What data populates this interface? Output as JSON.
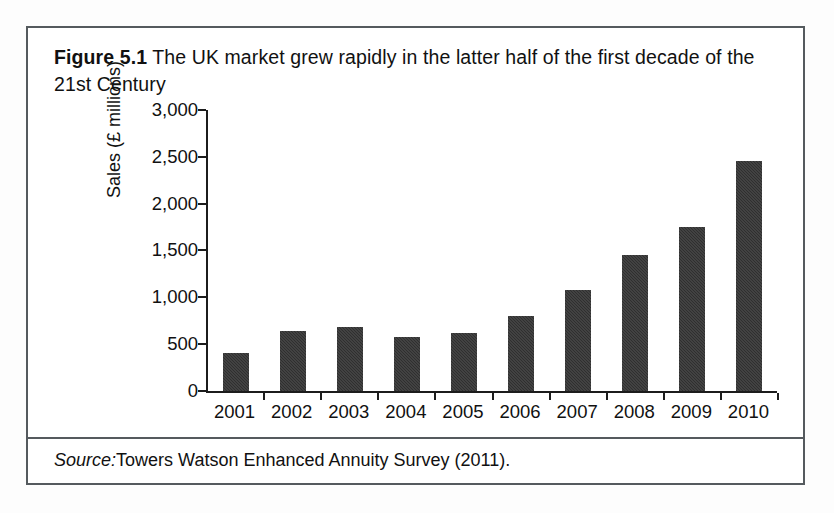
{
  "figure": {
    "caption_label": "Figure 5.1",
    "caption_text": "The UK market grew rapidly in the latter half of the first decade of the 21st Century",
    "source_label": "Source:",
    "source_text": "Towers Watson Enhanced Annuity Survey (2011).",
    "frame_color": "#555a5e",
    "bar_color": "#2f2f2f"
  },
  "chart_data": {
    "type": "bar",
    "title": "The UK market grew rapidly in the latter half of the first decade of the 21st Century",
    "xlabel": "",
    "ylabel": "Sales (£ millions)",
    "categories": [
      "2001",
      "2002",
      "2003",
      "2004",
      "2005",
      "2006",
      "2007",
      "2008",
      "2009",
      "2010"
    ],
    "values": [
      410,
      635,
      680,
      575,
      620,
      800,
      1075,
      1450,
      1745,
      2450
    ],
    "ylim": [
      0,
      3000
    ],
    "yticks": [
      0,
      500,
      1000,
      1500,
      2000,
      2500,
      3000
    ],
    "ytick_labels": [
      "0",
      "500",
      "1,000",
      "1,500",
      "2,000",
      "2,500",
      "3,000"
    ],
    "grid": false,
    "legend": false,
    "series": [
      {
        "name": "Sales (£ millions)",
        "values": [
          410,
          635,
          680,
          575,
          620,
          800,
          1075,
          1450,
          1745,
          2450
        ]
      }
    ]
  }
}
